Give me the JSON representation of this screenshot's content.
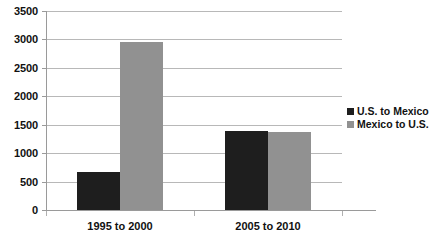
{
  "chart_data": {
    "type": "bar",
    "title": "",
    "subtitle": "",
    "xlabel": "",
    "ylabel": "",
    "categories": [
      "1995 to 2000",
      "2005 to 2010"
    ],
    "series": [
      {
        "name": "U.S. to Mexico",
        "color": "#1e1e1e",
        "values": [
          665,
          1395
        ]
      },
      {
        "name": "Mexico to U.S.",
        "color": "#919191",
        "values": [
          2950,
          1370
        ]
      }
    ],
    "ylim": [
      0,
      3500
    ],
    "yticks": [
      3500,
      3000,
      2500,
      2000,
      1500,
      1000,
      500,
      0
    ],
    "ytick_labels": [
      "3500",
      "3000",
      "2500",
      "2000",
      "1500",
      "1000",
      "500",
      "0"
    ],
    "grid": true,
    "grid_axis": "y",
    "legend_position": "right",
    "legend": [
      {
        "label": "U.S. to Mexico",
        "color": "#1e1e1e"
      },
      {
        "label": "Mexico to U.S.",
        "color": "#919191"
      }
    ]
  },
  "colors": {
    "background": "#ffffff",
    "gridline": "#b8b8b8",
    "axis": "#9a9a9a",
    "text": "#111111",
    "series_us_to_mexico": "#1e1e1e",
    "series_mexico_to_us": "#919191"
  }
}
